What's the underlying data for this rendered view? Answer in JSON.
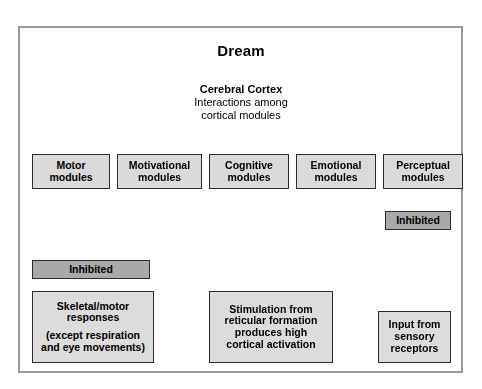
{
  "figure": {
    "title_top": "Dream",
    "cortex": {
      "heading": "Cerebral Cortex",
      "sub_line_1a": "Inter",
      "sub_line_1b": "ctions ",
      "sub_line_1c": "among",
      "sub_line_1_full": "Interactions among",
      "sub_line_2": "cortical modules"
    },
    "modules": [
      {
        "line1": "Motor",
        "line2": "modules"
      },
      {
        "line1": "Motivational",
        "line2": "modules"
      },
      {
        "line1": "Cognitive",
        "line2": "modules"
      },
      {
        "line1": "Emotional",
        "line2": "modules"
      },
      {
        "line1": "Perceptual",
        "line2": "modules"
      }
    ],
    "inhibited_left": "Inhibited",
    "inhibited_right": "Inhibited",
    "box_skeletal": {
      "line1": "Skeletal/motor",
      "line2": "responses",
      "line3": "(except respiration",
      "line4": "and eye movements)"
    },
    "box_reticular": {
      "line1": "Stimulation from",
      "line2": "reticular formation",
      "line3": "produces high",
      "line4": "cortical activation"
    },
    "box_sensory": {
      "line1": "Input from",
      "line2": "sensory",
      "line3": "receptors"
    },
    "colors": {
      "frame_border": "#9a9a9a",
      "box_fill": "#dadada",
      "inhibited_fill": "#a9a9a9",
      "box_stroke": "#2c2c2c",
      "brain_fill": "#d9d9d9",
      "brain_stroke": "#4a4a4a",
      "brain_shadow": "#c2c2c2",
      "arrow_fill": "#e8e8e8",
      "arrow_stroke": "#333333",
      "page_background": "#ffffff"
    }
  }
}
